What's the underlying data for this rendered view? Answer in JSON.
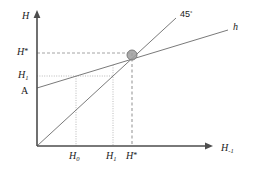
{
  "figure": {
    "axes": {
      "y_axis_title": "H",
      "x_axis_title_base": "H",
      "x_axis_title_sub": "-1",
      "origin_label": ""
    },
    "y_ticks": [
      {
        "id": "y-h-star",
        "base": "H",
        "sup": "*",
        "sub": "",
        "value_px": 53
      },
      {
        "id": "y-h-one",
        "base": "H",
        "sup": "",
        "sub": "1",
        "value_px": 76
      },
      {
        "id": "y-a",
        "base": "A",
        "sup": "",
        "sub": "",
        "value_px": 93
      }
    ],
    "x_ticks": [
      {
        "id": "x-h-zero",
        "base": "H",
        "sup": "",
        "sub": "0",
        "value_px": 76
      },
      {
        "id": "x-h-one",
        "base": "H",
        "sup": "",
        "sub": "1",
        "value_px": 113
      },
      {
        "id": "x-h-star",
        "base": "H",
        "sup": "*",
        "sub": "",
        "value_px": 132
      }
    ],
    "curves": [
      {
        "id": "line-45",
        "label": "45",
        "label_sup": "°",
        "kind": "identity-line"
      },
      {
        "id": "line-h",
        "label": "h",
        "label_sup": "",
        "kind": "transition-function"
      }
    ],
    "marker": {
      "id": "equilibrium-point",
      "color": "#9a9a9a",
      "stroke": "#6e6e6e"
    },
    "colors": {
      "axis": "#4d4d4d",
      "curve": "#7a7a7a",
      "guide": "#9a9a9a",
      "text": "#1a1a1a",
      "background": "#ffffff"
    }
  }
}
